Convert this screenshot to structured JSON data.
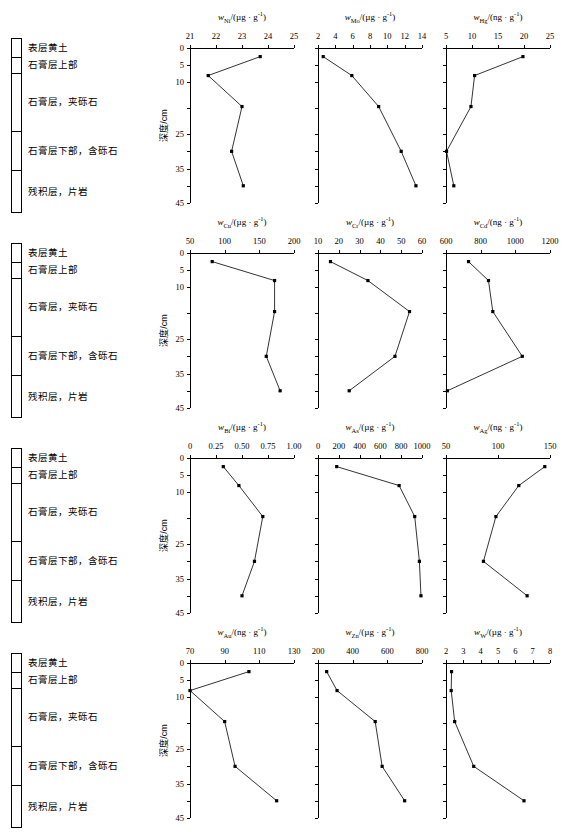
{
  "figure": {
    "depth_axis_label": "深度/cm",
    "depth_ticks": [
      0,
      5,
      10,
      25,
      35,
      45
    ],
    "depth_tick_labels": [
      "0",
      "5",
      "10",
      "25",
      "35",
      "45"
    ],
    "sample_depths": [
      2.5,
      8,
      17,
      30,
      40
    ]
  },
  "stratigraphy": {
    "units": [
      {
        "label": "表层黄土",
        "top": 0,
        "bottom": 5
      },
      {
        "label": "石膏层上部",
        "top": 5,
        "bottom": 9
      },
      {
        "label": "石膏层，夹砾石",
        "top": 9,
        "bottom": 24
      },
      {
        "label": "石膏层下部，含砾石",
        "top": 24,
        "bottom": 34
      },
      {
        "label": "残积层，片岩",
        "top": 34,
        "bottom": 45
      }
    ]
  },
  "chart_data": [
    {
      "id": "ni",
      "type": "line",
      "title": "w_Ni/(µg·g⁻¹)",
      "element": "Ni",
      "unit": "µg · g",
      "unit_exp": "-1",
      "xlabel": "",
      "ylabel": "深度/cm",
      "xlim": [
        21,
        25
      ],
      "xticks": [
        21,
        22,
        23,
        24,
        25
      ],
      "xtick_labels": [
        "21",
        "22",
        "23",
        "24",
        "25"
      ],
      "ylim": [
        0,
        45
      ],
      "x": [
        23.7,
        21.7,
        23.0,
        22.6,
        23.05
      ],
      "y": [
        2.5,
        8,
        17,
        30,
        40
      ]
    },
    {
      "id": "mo",
      "type": "line",
      "title": "w_Mo/(µg·g⁻¹)",
      "element": "Mo",
      "unit": "µg · g",
      "unit_exp": "-1",
      "xlabel": "",
      "ylabel": "深度/cm",
      "xlim": [
        2,
        14
      ],
      "xticks": [
        2,
        4,
        6,
        8,
        10,
        12,
        14
      ],
      "xtick_labels": [
        "2",
        "4",
        "6",
        "8",
        "10",
        "12",
        "14"
      ],
      "ylim": [
        0,
        45
      ],
      "x": [
        2.6,
        5.9,
        9.0,
        11.6,
        13.3
      ],
      "y": [
        2.5,
        8,
        17,
        30,
        40
      ]
    },
    {
      "id": "hg",
      "type": "line",
      "title": "w_Hg/(ng·g⁻¹)",
      "element": "Hg",
      "unit": "ng · g",
      "unit_exp": "-1",
      "xlabel": "",
      "ylabel": "深度/cm",
      "xlim": [
        5,
        25
      ],
      "xticks": [
        5,
        10,
        15,
        20,
        25
      ],
      "xtick_labels": [
        "5",
        "10",
        "15",
        "20",
        "25"
      ],
      "ylim": [
        0,
        45
      ],
      "x": [
        19.8,
        10.5,
        9.8,
        5.1,
        6.5
      ],
      "y": [
        2.5,
        8,
        17,
        30,
        40
      ]
    },
    {
      "id": "cu",
      "type": "line",
      "title": "w_Cu/(µg·g⁻¹)",
      "element": "Cu",
      "unit": "µg · g",
      "unit_exp": "-1",
      "xlabel": "",
      "ylabel": "深度/cm",
      "xlim": [
        50,
        200
      ],
      "xticks": [
        50,
        100,
        150,
        200
      ],
      "xtick_labels": [
        "50",
        "100",
        "150",
        "200"
      ],
      "ylim": [
        0,
        45
      ],
      "x": [
        82,
        172,
        172,
        160,
        180
      ],
      "y": [
        2.5,
        8,
        17,
        30,
        40
      ]
    },
    {
      "id": "cr",
      "type": "line",
      "title": "w_Cr/(µg·g⁻¹)",
      "element": "Cr",
      "unit": "µg · g",
      "unit_exp": "-1",
      "xlabel": "",
      "ylabel": "深度/cm",
      "xlim": [
        10,
        60
      ],
      "xticks": [
        10,
        20,
        30,
        40,
        50,
        60
      ],
      "xtick_labels": [
        "10",
        "20",
        "30",
        "40",
        "50",
        "60"
      ],
      "ylim": [
        0,
        45
      ],
      "x": [
        16,
        34,
        54,
        47,
        25
      ],
      "y": [
        2.5,
        8,
        17,
        30,
        40
      ]
    },
    {
      "id": "cd",
      "type": "line",
      "title": "w_Cd/(ng·g⁻¹)",
      "element": "Cd",
      "unit": "ng · g",
      "unit_exp": "-1",
      "xlabel": "",
      "ylabel": "深度/cm",
      "xlim": [
        600,
        1200
      ],
      "xticks": [
        600,
        800,
        1000,
        1200
      ],
      "xtick_labels": [
        "600",
        "800",
        "1000",
        "1200"
      ],
      "ylim": [
        0,
        45
      ],
      "x": [
        730,
        845,
        870,
        1040,
        608
      ],
      "y": [
        2.5,
        8,
        17,
        30,
        40
      ]
    },
    {
      "id": "bi",
      "type": "line",
      "title": "w_Bi/(µg·g⁻¹)",
      "element": "Bi",
      "unit": "µg · g",
      "unit_exp": "-1",
      "xlabel": "",
      "ylabel": "深度/cm",
      "xlim": [
        0,
        1.0
      ],
      "xticks": [
        0,
        0.25,
        0.5,
        0.75,
        1.0
      ],
      "xtick_labels": [
        "0",
        "0.25",
        "0.50",
        "0.75",
        "1.00"
      ],
      "ylim": [
        0,
        45
      ],
      "x": [
        0.32,
        0.47,
        0.7,
        0.62,
        0.5
      ],
      "y": [
        2.5,
        8,
        17,
        30,
        40
      ]
    },
    {
      "id": "as",
      "type": "line",
      "title": "w_As/(µg·g⁻¹)",
      "element": "As",
      "unit": "µg · g",
      "unit_exp": "-1",
      "xlabel": "",
      "ylabel": "深度/cm",
      "xlim": [
        0,
        1000
      ],
      "xticks": [
        0,
        200,
        400,
        600,
        800,
        1000
      ],
      "xtick_labels": [
        "0",
        "200",
        "400",
        "600",
        "800",
        "1000"
      ],
      "ylim": [
        0,
        45
      ],
      "x": [
        180,
        780,
        930,
        975,
        990
      ],
      "y": [
        2.5,
        8,
        17,
        30,
        40
      ]
    },
    {
      "id": "ag",
      "type": "line",
      "title": "w_Ag/(ng·g⁻¹)",
      "element": "Ag",
      "unit": "ng · g",
      "unit_exp": "-1",
      "xlabel": "",
      "ylabel": "深度/cm",
      "xlim": [
        50,
        150
      ],
      "xticks": [
        50,
        100,
        150
      ],
      "xtick_labels": [
        "50",
        "100",
        "150"
      ],
      "ylim": [
        0,
        45
      ],
      "x": [
        145,
        120,
        98,
        86,
        128
      ],
      "y": [
        2.5,
        8,
        17,
        30,
        40
      ]
    },
    {
      "id": "au",
      "type": "line",
      "title": "w_Au/(ng·g⁻¹)",
      "element": "Au",
      "unit": "ng · g",
      "unit_exp": "-1",
      "xlabel": "",
      "ylabel": "深度/cm",
      "xlim": [
        70,
        130
      ],
      "xticks": [
        70,
        90,
        110,
        130
      ],
      "xtick_labels": [
        "70",
        "90",
        "110",
        "130"
      ],
      "ylim": [
        0,
        45
      ],
      "x": [
        104,
        70,
        90,
        96,
        120
      ],
      "y": [
        2.5,
        8,
        17,
        30,
        40
      ]
    },
    {
      "id": "zn",
      "type": "line",
      "title": "w_Zn/(µg·g⁻¹)",
      "element": "Zn",
      "unit": "µg · g",
      "unit_exp": "-1",
      "xlabel": "",
      "ylabel": "深度/cm",
      "xlim": [
        200,
        800
      ],
      "xticks": [
        200,
        400,
        600,
        800
      ],
      "xtick_labels": [
        "200",
        "400",
        "600",
        "800"
      ],
      "ylim": [
        0,
        45
      ],
      "x": [
        250,
        310,
        530,
        570,
        700
      ],
      "y": [
        2.5,
        8,
        17,
        30,
        40
      ]
    },
    {
      "id": "w",
      "type": "line",
      "title": "w_W/(µg·g⁻¹)",
      "element": "W",
      "unit": "µg · g",
      "unit_exp": "-1",
      "xlabel": "",
      "ylabel": "深度/cm",
      "xlim": [
        2,
        8
      ],
      "xticks": [
        2,
        3,
        4,
        5,
        6,
        7,
        8
      ],
      "xtick_labels": [
        "2",
        "3",
        "4",
        "5",
        "6",
        "7",
        "8"
      ],
      "ylim": [
        0,
        45
      ],
      "x": [
        2.32,
        2.3,
        2.5,
        3.6,
        6.5
      ],
      "y": [
        2.5,
        8,
        17,
        30,
        40
      ]
    }
  ]
}
